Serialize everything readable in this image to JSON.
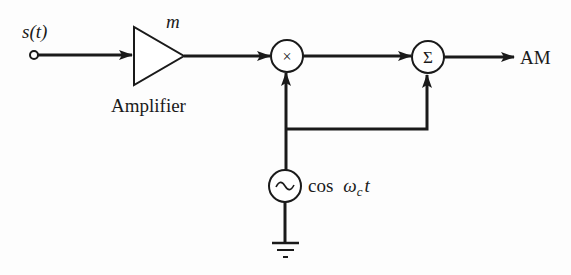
{
  "diagram": {
    "type": "block-diagram",
    "colors": {
      "stroke": "#1a1a1a",
      "background": "#fdfdfd"
    },
    "input": {
      "label": "s(t)"
    },
    "amplifier": {
      "label": "Amplifier",
      "gain_label": "m"
    },
    "multiplier": {
      "symbol": "×"
    },
    "summer": {
      "symbol": "Σ"
    },
    "oscillator": {
      "symbol": "~",
      "label_func": "cos",
      "label_omega": "ω",
      "label_sub": "c",
      "label_t": "t"
    },
    "output": {
      "label": "AM"
    },
    "ground": {
      "name": "ground"
    },
    "connections": [
      {
        "from": "input",
        "to": "amplifier"
      },
      {
        "from": "amplifier",
        "to": "multiplier"
      },
      {
        "from": "multiplier",
        "to": "summer"
      },
      {
        "from": "oscillator",
        "to": "multiplier"
      },
      {
        "from": "oscillator",
        "to": "summer"
      },
      {
        "from": "summer",
        "to": "output"
      },
      {
        "from": "oscillator",
        "to": "ground"
      }
    ]
  }
}
